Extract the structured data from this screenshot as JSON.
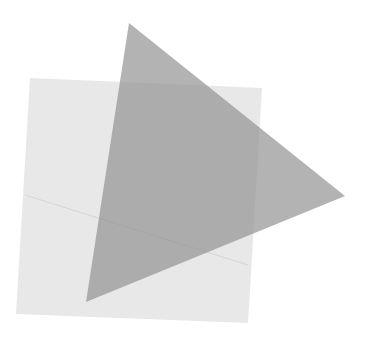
{
  "canvas": {
    "width": 365,
    "height": 341,
    "background": "#ffffff"
  },
  "shapes": {
    "square": {
      "points": "30,78 262,88 248,323 16,314",
      "fill": "#e4e4e4",
      "opacity": "0.85"
    },
    "fold_line": {
      "x1": 25,
      "y1": 195,
      "x2": 248,
      "y2": 265,
      "stroke": "#d6d6d6"
    },
    "triangle": {
      "points": "129,23 345,196 86,302",
      "fill": "#8f8f8f",
      "opacity": "0.68"
    }
  }
}
